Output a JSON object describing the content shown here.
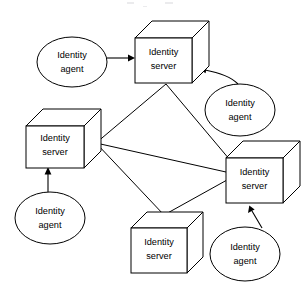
{
  "diagram": {
    "background_color": "#ffffff",
    "line_color": "#000000",
    "servers": [
      {
        "id": "server-top",
        "label_line1": "Identity",
        "label_line2": "server",
        "x": 135,
        "y": 38,
        "w": 57,
        "h": 45,
        "depth": 17
      },
      {
        "id": "server-left",
        "label_line1": "Identity",
        "label_line2": "server",
        "x": 26,
        "y": 126,
        "w": 58,
        "h": 42,
        "depth": 17
      },
      {
        "id": "server-right",
        "label_line1": "Identity",
        "label_line2": "server",
        "x": 226,
        "y": 158,
        "w": 57,
        "h": 45,
        "depth": 17
      },
      {
        "id": "server-bottom",
        "label_line1": "Identity",
        "label_line2": "server",
        "x": 131,
        "y": 228,
        "w": 56,
        "h": 45,
        "depth": 16
      }
    ],
    "agents": [
      {
        "id": "agent-topleft",
        "label_line1": "Identity",
        "label_line2": "agent",
        "cx": 72,
        "cy": 62,
        "rx": 35,
        "ry": 25
      },
      {
        "id": "agent-right",
        "label_line1": "Identity",
        "label_line2": "agent",
        "cx": 240,
        "cy": 110,
        "rx": 35,
        "ry": 26
      },
      {
        "id": "agent-bottomleft",
        "label_line1": "Identity",
        "label_line2": "agent",
        "cx": 50,
        "cy": 218,
        "rx": 35,
        "ry": 26
      },
      {
        "id": "agent-bottomright",
        "label_line1": "Identity",
        "label_line2": "agent",
        "cx": 245,
        "cy": 254,
        "rx": 35,
        "ry": 27
      }
    ],
    "server_links": [
      {
        "id": "link-left-top",
        "from": "server-left",
        "to": "server-top"
      },
      {
        "id": "link-left-right",
        "from": "server-left",
        "to": "server-right"
      },
      {
        "id": "link-left-bottom",
        "from": "server-left",
        "to": "server-bottom"
      },
      {
        "id": "link-top-right",
        "from": "server-top",
        "to": "server-right"
      },
      {
        "id": "link-bottom-right",
        "from": "server-bottom",
        "to": "server-right"
      }
    ],
    "agent_links": [
      {
        "id": "arrow-topleft-to-top",
        "from": "agent-topleft",
        "to": "server-top",
        "direction": "right"
      },
      {
        "id": "arrow-right-to-top",
        "from": "agent-right",
        "to": "server-top",
        "direction": "up-left"
      },
      {
        "id": "arrow-bottomleft-to-left",
        "from": "agent-bottomleft",
        "to": "server-left",
        "direction": "up"
      },
      {
        "id": "arrow-bottomright-to-right",
        "from": "agent-bottomright",
        "to": "server-right",
        "direction": "up-left"
      }
    ]
  }
}
